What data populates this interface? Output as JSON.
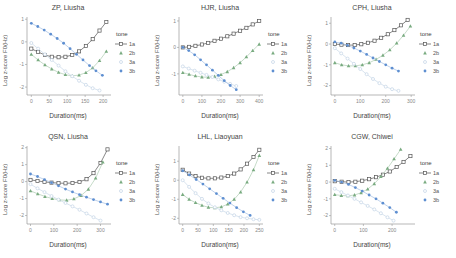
{
  "figure": {
    "x_axis_label": "Duration(ms)",
    "y_axis_label": "Log z-score F0(Hz)"
  },
  "legend": {
    "title": "tone",
    "items": [
      {
        "tone": "1a",
        "label": "1a",
        "marker": "open-square",
        "color": "#555555",
        "line_color": "#555555",
        "legend_line": true
      },
      {
        "tone": "2b",
        "label": "2b",
        "marker": "filled-triangle",
        "color": "#79ab80",
        "line_color": "#aecbb2",
        "legend_line": false
      },
      {
        "tone": "3a",
        "label": "3a",
        "marker": "open-circle",
        "color": "#c9d8e8",
        "line_color": "#c9d8e8",
        "legend_line": false
      },
      {
        "tone": "3b",
        "label": "3b",
        "marker": "filled-circle",
        "color": "#5e8fd1",
        "line_color": "#a3bfe4",
        "legend_line": false
      }
    ]
  },
  "chart_data": {
    "note": "see charts array",
    "type": "line"
  },
  "charts": [
    {
      "title": "ZP, Liusha",
      "xlim": [
        -12,
        222
      ],
      "ylim": [
        -2.35,
        1.1
      ],
      "xticks": [
        0,
        50,
        100,
        150,
        200
      ],
      "yticks": [
        1,
        0,
        -1,
        -2
      ],
      "series": [
        {
          "tone": "1a",
          "x": [
            0,
            19,
            38,
            57,
            76,
            95,
            114,
            133,
            152,
            171,
            190,
            209
          ],
          "y": [
            -0.3,
            -0.45,
            -0.58,
            -0.66,
            -0.68,
            -0.66,
            -0.58,
            -0.42,
            -0.18,
            0.12,
            0.5,
            0.88
          ]
        },
        {
          "tone": "2b",
          "x": [
            0,
            19,
            38,
            57,
            76,
            95,
            114,
            133,
            152,
            171,
            190,
            209
          ],
          "y": [
            -0.55,
            -0.8,
            -1.02,
            -1.2,
            -1.35,
            -1.45,
            -1.5,
            -1.47,
            -1.36,
            -1.15,
            -0.83,
            -0.42
          ]
        },
        {
          "tone": "3a",
          "x": [
            0,
            19,
            38,
            57,
            76,
            95,
            114,
            133,
            152,
            171,
            190
          ],
          "y": [
            -0.05,
            -0.3,
            -0.55,
            -0.8,
            -1.05,
            -1.3,
            -1.52,
            -1.72,
            -1.9,
            -2.05,
            -2.15
          ]
        },
        {
          "tone": "3b",
          "x": [
            0,
            18,
            36,
            54,
            72,
            90,
            108,
            126,
            144,
            162,
            180,
            198
          ],
          "y": [
            0.82,
            0.68,
            0.52,
            0.34,
            0.15,
            -0.06,
            -0.3,
            -0.55,
            -0.8,
            -1.05,
            -1.28,
            -1.48
          ]
        }
      ]
    },
    {
      "title": "HJR, Liusha",
      "xlim": [
        -20,
        420
      ],
      "ylim": [
        -1.8,
        1.15
      ],
      "xticks": [
        0,
        100,
        200,
        300,
        400
      ],
      "yticks": [
        1,
        0,
        -1
      ],
      "series": [
        {
          "tone": "1a",
          "x": [
            0,
            33,
            66,
            100,
            133,
            166,
            200,
            233,
            266,
            300,
            333,
            366,
            400
          ],
          "y": [
            0.0,
            0.02,
            0.06,
            0.11,
            0.17,
            0.25,
            0.33,
            0.42,
            0.52,
            0.63,
            0.74,
            0.87,
            1.0
          ]
        },
        {
          "tone": "2b",
          "x": [
            0,
            33,
            66,
            100,
            133,
            166,
            200,
            233,
            266,
            300,
            333,
            366,
            400
          ],
          "y": [
            -0.95,
            -1.02,
            -1.08,
            -1.12,
            -1.13,
            -1.1,
            -1.03,
            -0.92,
            -0.77,
            -0.58,
            -0.36,
            -0.12,
            0.12
          ]
        },
        {
          "tone": "3a",
          "x": [
            0,
            31,
            62,
            93,
            124,
            155,
            186,
            217,
            248,
            280
          ],
          "y": [
            -0.72,
            -0.8,
            -0.88,
            -0.96,
            -1.04,
            -1.12,
            -1.21,
            -1.3,
            -1.38,
            -1.46
          ]
        },
        {
          "tone": "3b",
          "x": [
            0,
            31,
            62,
            93,
            124,
            155,
            186,
            217,
            248,
            280
          ],
          "y": [
            0.0,
            -0.12,
            -0.28,
            -0.47,
            -0.66,
            -0.86,
            -1.06,
            -1.26,
            -1.44,
            -1.6
          ]
        }
      ]
    },
    {
      "title": "CPH, Liusha",
      "xlim": [
        -15,
        315
      ],
      "ylim": [
        -2.45,
        1.3
      ],
      "xticks": [
        0,
        100,
        200,
        300
      ],
      "yticks": [
        1,
        0,
        -1,
        -2
      ],
      "series": [
        {
          "tone": "1a",
          "x": [
            0,
            26,
            52,
            78,
            104,
            130,
            156,
            182,
            208,
            234,
            260,
            286
          ],
          "y": [
            0.0,
            -0.03,
            -0.05,
            -0.05,
            -0.01,
            0.06,
            0.16,
            0.3,
            0.47,
            0.67,
            0.9,
            1.16
          ]
        },
        {
          "tone": "2b",
          "x": [
            0,
            27,
            54,
            81,
            108,
            135,
            162,
            189,
            216,
            243,
            270,
            297
          ],
          "y": [
            -0.9,
            -1.0,
            -1.05,
            -1.05,
            -1.0,
            -0.9,
            -0.74,
            -0.54,
            -0.28,
            0.04,
            0.42,
            0.86
          ]
        },
        {
          "tone": "3a",
          "x": [
            0,
            25,
            50,
            75,
            100,
            125,
            150,
            175,
            200,
            225,
            250
          ],
          "y": [
            -0.2,
            -0.45,
            -0.7,
            -0.95,
            -1.2,
            -1.45,
            -1.68,
            -1.88,
            -2.05,
            -2.17,
            -2.25
          ]
        },
        {
          "tone": "3b",
          "x": [
            0,
            25,
            50,
            75,
            100,
            125,
            150,
            175,
            200,
            225,
            250
          ],
          "y": [
            0.1,
            0.04,
            -0.06,
            -0.19,
            -0.34,
            -0.5,
            -0.67,
            -0.84,
            -1.0,
            -1.16,
            -1.3
          ]
        }
      ]
    },
    {
      "title": "QSN, Liusha",
      "xlim": [
        -15,
        345
      ],
      "ylim": [
        -2.5,
        2.1
      ],
      "xticks": [
        0,
        100,
        200,
        300
      ],
      "yticks": [
        2,
        1,
        0,
        -1,
        -2
      ],
      "series": [
        {
          "tone": "1a",
          "x": [
            0,
            30,
            60,
            90,
            120,
            150,
            180,
            210,
            240,
            270,
            300,
            330
          ],
          "y": [
            0.1,
            0.04,
            -0.02,
            -0.06,
            -0.09,
            -0.1,
            -0.08,
            -0.02,
            0.14,
            0.5,
            1.1,
            1.9
          ]
        },
        {
          "tone": "2b",
          "x": [
            0,
            31,
            62,
            93,
            124,
            155,
            186,
            217,
            248,
            279,
            310
          ],
          "y": [
            -0.55,
            -0.72,
            -0.88,
            -1.0,
            -1.08,
            -1.1,
            -1.02,
            -0.82,
            -0.45,
            0.2,
            1.15
          ]
        },
        {
          "tone": "3a",
          "x": [
            0,
            30,
            60,
            90,
            120,
            150,
            180,
            210,
            240,
            270,
            300
          ],
          "y": [
            -0.15,
            -0.4,
            -0.62,
            -0.85,
            -1.06,
            -1.26,
            -1.46,
            -1.66,
            -1.88,
            -2.1,
            -2.3
          ]
        },
        {
          "tone": "3b",
          "x": [
            0,
            30,
            60,
            90,
            120,
            150,
            180,
            210,
            240,
            270,
            300,
            330
          ],
          "y": [
            0.45,
            0.3,
            0.12,
            -0.06,
            -0.25,
            -0.44,
            -0.61,
            -0.77,
            -0.92,
            -1.06,
            -1.2,
            -1.33
          ]
        }
      ]
    },
    {
      "title": "LHL, Liaoyuan",
      "xlim": [
        -12,
        262
      ],
      "ylim": [
        -2.3,
        1.8
      ],
      "xticks": [
        0,
        50,
        100,
        150,
        200,
        250
      ],
      "yticks": [
        1,
        0,
        -1,
        -2
      ],
      "series": [
        {
          "tone": "1a",
          "x": [
            0,
            21,
            42,
            63,
            84,
            105,
            126,
            147,
            168,
            189,
            210,
            231,
            250
          ],
          "y": [
            0.55,
            0.35,
            0.22,
            0.13,
            0.1,
            0.1,
            0.14,
            0.22,
            0.35,
            0.57,
            0.87,
            1.22,
            1.6
          ]
        },
        {
          "tone": "2b",
          "x": [
            0,
            21,
            42,
            63,
            84,
            105,
            126,
            147,
            168,
            189,
            210,
            231,
            250
          ],
          "y": [
            -0.75,
            -1.0,
            -1.18,
            -1.32,
            -1.42,
            -1.45,
            -1.4,
            -1.26,
            -1.0,
            -0.62,
            -0.1,
            0.55,
            1.3
          ]
        },
        {
          "tone": "3a",
          "x": [
            0,
            21,
            42,
            63,
            84,
            105,
            126,
            147,
            168,
            189,
            210,
            231,
            250
          ],
          "y": [
            0.0,
            -0.35,
            -0.68,
            -0.98,
            -1.22,
            -1.42,
            -1.58,
            -1.72,
            -1.84,
            -1.94,
            -2.0,
            -2.05,
            -2.08
          ]
        },
        {
          "tone": "3b",
          "x": [
            0,
            22,
            44,
            66,
            88,
            110,
            132,
            154,
            176,
            198,
            220
          ],
          "y": [
            0.5,
            0.28,
            0.04,
            -0.2,
            -0.45,
            -0.7,
            -0.95,
            -1.2,
            -1.44,
            -1.66,
            -1.85
          ]
        }
      ]
    },
    {
      "title": "CGW, Chiwei",
      "xlim": [
        -13,
        280
      ],
      "ylim": [
        -2.5,
        2.15
      ],
      "xticks": [
        0,
        100,
        200
      ],
      "yticks": [
        2,
        1,
        0,
        -1,
        -2
      ],
      "series": [
        {
          "tone": "1a",
          "x": [
            0,
            24,
            48,
            72,
            96,
            120,
            144,
            168,
            192,
            216,
            240,
            264
          ],
          "y": [
            0.05,
            0.02,
            0.0,
            0.02,
            0.08,
            0.17,
            0.29,
            0.44,
            0.63,
            0.9,
            1.2,
            1.55
          ]
        },
        {
          "tone": "2b",
          "x": [
            0,
            23,
            46,
            69,
            92,
            115,
            138,
            161,
            184,
            207,
            230
          ],
          "y": [
            -0.75,
            -0.8,
            -0.82,
            -0.77,
            -0.64,
            -0.42,
            -0.1,
            0.32,
            0.82,
            1.38,
            1.95
          ]
        },
        {
          "tone": "3a",
          "x": [
            0,
            23,
            46,
            69,
            92,
            115,
            138,
            161,
            184,
            205
          ],
          "y": [
            -0.4,
            -0.6,
            -0.8,
            -1.0,
            -1.21,
            -1.42,
            -1.63,
            -1.86,
            -2.1,
            -2.3
          ]
        },
        {
          "tone": "3b",
          "x": [
            0,
            24,
            48,
            72,
            96,
            120,
            144,
            168,
            192,
            215
          ],
          "y": [
            0.1,
            0.0,
            -0.14,
            -0.33,
            -0.54,
            -0.77,
            -1.0,
            -1.26,
            -1.52,
            -1.8
          ]
        }
      ]
    }
  ]
}
